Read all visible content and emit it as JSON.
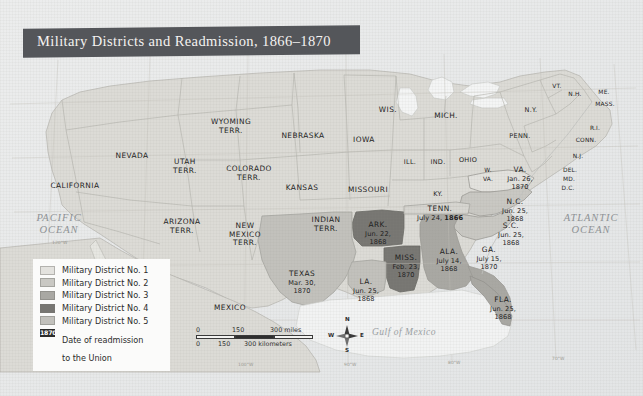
{
  "title": "Military Districts and Readmission, 1866–1870",
  "legend": {
    "items": [
      {
        "label": "Military District No. 1",
        "color": "#e3e2de"
      },
      {
        "label": "Military District No. 2",
        "color": "#c9c8c3"
      },
      {
        "label": "Military District No. 3",
        "color": "#a9a8a3"
      },
      {
        "label": "Military District No. 4",
        "color": "#777672"
      },
      {
        "label": "Military District No. 5",
        "color": "#c2c1bc"
      }
    ],
    "date_key": {
      "chip": "1870",
      "line1": "Date of readmission",
      "line2": "to the Union"
    }
  },
  "oceans": {
    "pacific_line1": "PACIFIC",
    "pacific_line2": "OCEAN",
    "atlantic_line1": "ATLANTIC",
    "atlantic_line2": "OCEAN",
    "gulf": "Gulf of Mexico"
  },
  "scalebar": {
    "miles": {
      "zero": "0",
      "mid": "150",
      "max": "300 miles"
    },
    "kilometers": {
      "zero": "0",
      "mid": "150",
      "max": "300 kilometers"
    }
  },
  "compass": {
    "n": "N",
    "s": "S",
    "e": "E",
    "w": "W"
  },
  "coords": {
    "c120w_left": "120°W",
    "c120w_bottom": "120°W",
    "c110w": "110°W",
    "c100w": "100°W",
    "c90w": "90°W",
    "c80w": "80°W",
    "c70w": "70°W"
  },
  "states": [
    {
      "name": "CALIFORNIA",
      "date": "",
      "year": ""
    },
    {
      "name": "NEVADA",
      "date": "",
      "year": ""
    },
    {
      "name": "UTAH",
      "name2": "TERR.",
      "date": "",
      "year": ""
    },
    {
      "name": "ARIZONA",
      "name2": "TERR.",
      "date": "",
      "year": ""
    },
    {
      "name": "NEW",
      "name2": "MEXICO",
      "name3": "TERR.",
      "date": "",
      "year": ""
    },
    {
      "name": "COLORADO",
      "name2": "TERR.",
      "date": "",
      "year": ""
    },
    {
      "name": "WYOMING",
      "name2": "TERR.",
      "date": "",
      "year": ""
    },
    {
      "name": "NEBRASKA",
      "date": "",
      "year": ""
    },
    {
      "name": "KANSAS",
      "date": "",
      "year": ""
    },
    {
      "name": "INDIAN",
      "name2": "TERR.",
      "date": "",
      "year": ""
    },
    {
      "name": "WIS.",
      "date": "",
      "year": ""
    },
    {
      "name": "IOWA",
      "date": "",
      "year": ""
    },
    {
      "name": "MISSOURI",
      "date": "",
      "year": ""
    },
    {
      "name": "MICH.",
      "date": "",
      "year": ""
    },
    {
      "name": "ILL.",
      "date": "",
      "year": ""
    },
    {
      "name": "IND.",
      "date": "",
      "year": ""
    },
    {
      "name": "OHIO",
      "date": "",
      "year": ""
    },
    {
      "name": "KY.",
      "date": "",
      "year": ""
    },
    {
      "name": "PENN.",
      "date": "",
      "year": ""
    },
    {
      "name": "N.Y.",
      "date": "",
      "year": ""
    },
    {
      "name": "VT.",
      "date": "",
      "year": ""
    },
    {
      "name": "N.H.",
      "date": "",
      "year": ""
    },
    {
      "name": "ME.",
      "date": "",
      "year": ""
    },
    {
      "name": "MASS.",
      "date": "",
      "year": ""
    },
    {
      "name": "R.I.",
      "date": "",
      "year": ""
    },
    {
      "name": "CONN.",
      "date": "",
      "year": ""
    },
    {
      "name": "N.J.",
      "date": "",
      "year": ""
    },
    {
      "name": "DEL.",
      "date": "",
      "year": ""
    },
    {
      "name": "MD.",
      "date": "",
      "year": ""
    },
    {
      "name": "D.C.",
      "date": "",
      "year": ""
    },
    {
      "name": "W.",
      "name2": "VA.",
      "date": "",
      "year": ""
    },
    {
      "name": "MEXICO",
      "date": "",
      "year": ""
    }
  ],
  "readmitted": {
    "tenn": {
      "name": "TENN.",
      "date": "July 24,",
      "year": "1866",
      "district": ""
    },
    "ark": {
      "name": "ARK.",
      "date": "Jun. 22,",
      "year": "1868",
      "district": "4"
    },
    "la": {
      "name": "LA.",
      "date": "Jun. 25,",
      "year": "1868",
      "district": "5"
    },
    "ala": {
      "name": "ALA.",
      "date": "July 14,",
      "year": "1868",
      "district": "3"
    },
    "sc": {
      "name": "S.C.",
      "date": "Jun. 25,",
      "year": "1868",
      "district": "2"
    },
    "nc": {
      "name": "N.C.",
      "date": "Jun. 25,",
      "year": "1868",
      "district": "2"
    },
    "fla": {
      "name": "FLA.",
      "date": "Jun. 25,",
      "year": "1868",
      "district": "3"
    },
    "va": {
      "name": "VA.",
      "date": "Jan. 26,",
      "year": "1870",
      "district": "1"
    },
    "miss": {
      "name": "MISS.",
      "date": "Feb. 23,",
      "year": "1870",
      "district": "4"
    },
    "texas": {
      "name": "TEXAS",
      "date": "Mar. 30,",
      "year": "1870",
      "district": "5"
    },
    "ga": {
      "name": "GA.",
      "date": "July 15,",
      "year": "1870",
      "district": "3"
    }
  }
}
